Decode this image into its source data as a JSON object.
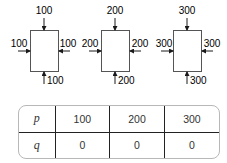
{
  "diagrams": [
    {
      "top": "100",
      "left": "100",
      "right": "100",
      "bottom": "100"
    },
    {
      "top": "200",
      "left": "200",
      "right": "200",
      "bottom": "200"
    },
    {
      "top": "300",
      "left": "300",
      "right": "300",
      "bottom": "300"
    }
  ],
  "table": {
    "rows": [
      {
        "label": "p",
        "values": [
          "100",
          "200",
          "300"
        ]
      },
      {
        "label": "q",
        "values": [
          "0",
          "0",
          "0"
        ]
      }
    ]
  },
  "colors": {
    "stroke": "#1a1a1a",
    "table_border": "#b8b8b8"
  }
}
